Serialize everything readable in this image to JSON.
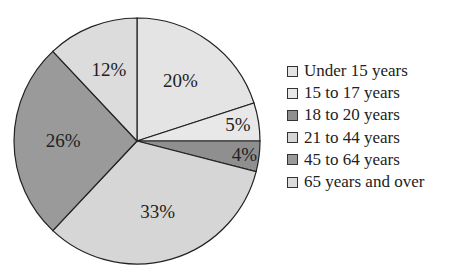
{
  "chart_data": {
    "type": "pie",
    "title": "",
    "categories": [
      "Under 15 years",
      "15 to 17 years",
      "18 to 20 years",
      "21 to 44 years",
      "45 to 64 years",
      "65 years and over"
    ],
    "values": [
      20,
      5,
      4,
      33,
      26,
      12
    ],
    "labels": [
      "20%",
      "5%",
      "4%",
      "33%",
      "26%",
      "12%"
    ],
    "colors": [
      "#e4e4e4",
      "#e8e8e8",
      "#8f8f8f",
      "#d6d6d6",
      "#9a9a9a",
      "#dcdcdc"
    ],
    "start_angle": "12 o'clock",
    "direction": "clockwise",
    "legend_position": "right"
  },
  "legend": {
    "items": [
      {
        "label": "Under 15 years",
        "color": "#e4e4e4"
      },
      {
        "label": "15 to 17 years",
        "color": "#e8e8e8"
      },
      {
        "label": "18 to 20 years",
        "color": "#8f8f8f"
      },
      {
        "label": "21 to 44 years",
        "color": "#d6d6d6"
      },
      {
        "label": "45 to 64 years",
        "color": "#9a9a9a"
      },
      {
        "label": "65 years and over",
        "color": "#dcdcdc"
      }
    ]
  }
}
